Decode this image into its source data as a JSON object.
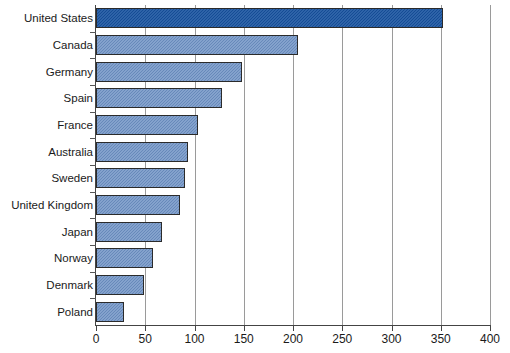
{
  "chart_data": {
    "type": "bar",
    "orientation": "horizontal",
    "title": "",
    "subtitle": "",
    "xlabel": "",
    "ylabel": "",
    "xlim": [
      0,
      400
    ],
    "xticks": [
      0,
      50,
      100,
      150,
      200,
      250,
      300,
      350,
      400
    ],
    "xtick_labels": [
      "0",
      "50",
      "100",
      "150",
      "200",
      "250",
      "300",
      "350",
      "400"
    ],
    "grid": true,
    "grid_axis": "x",
    "legend": false,
    "legend_position": "none",
    "categories": [
      "United States",
      "Canada",
      "Germany",
      "Spain",
      "France",
      "Australia",
      "Sweden",
      "United Kingdom",
      "Japan",
      "Norway",
      "Denmark",
      "Poland"
    ],
    "values": [
      352,
      205,
      148,
      128,
      104,
      93,
      90,
      85,
      67,
      58,
      49,
      28
    ],
    "colors": {
      "bar_default": "#6d90c4",
      "bar_highlight": "#16519e",
      "bar_border": "#2b2b2b",
      "gridline": "#9a9a9a",
      "axis": "#444444",
      "text": "#1a1a1a",
      "background": "#ffffff"
    },
    "highlight_index": 0
  }
}
